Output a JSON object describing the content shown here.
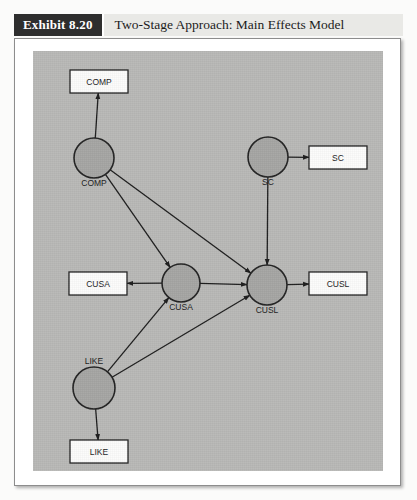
{
  "header": {
    "exhibit_tag": "Exhibit 8.20",
    "title": "Two-Stage Approach: Main Effects Model"
  },
  "colors": {
    "tag_background": "#2e2e2e",
    "tag_text": "#ffffff",
    "title_background": "#e9e9e6",
    "canvas_background": "#b9b9b7",
    "construct_fill": "#a6a6a4",
    "indicator_fill": "#fcfcfb",
    "stroke": "#232323"
  },
  "diagram": {
    "type": "path-model",
    "constructs": [
      {
        "id": "COMP",
        "label": "COMP",
        "cx": 61,
        "cy": 107,
        "r": 20,
        "label_position": "below"
      },
      {
        "id": "SC",
        "label": "SC",
        "cx": 235,
        "cy": 106,
        "r": 20,
        "label_position": "below"
      },
      {
        "id": "CUSA",
        "label": "CUSA",
        "cx": 148,
        "cy": 232,
        "r": 19,
        "label_position": "below"
      },
      {
        "id": "CUSL",
        "label": "CUSL",
        "cx": 234,
        "cy": 234,
        "r": 20,
        "label_position": "below"
      },
      {
        "id": "LIKE",
        "label": "LIKE",
        "cx": 61,
        "cy": 337,
        "r": 21,
        "label_position": "above"
      }
    ],
    "indicators": [
      {
        "id": "COMP_ind",
        "label": "COMP",
        "x": 37,
        "y": 19,
        "w": 58,
        "h": 23
      },
      {
        "id": "SC_ind",
        "label": "SC",
        "x": 276,
        "y": 95,
        "w": 58,
        "h": 23
      },
      {
        "id": "CUSA_ind",
        "label": "CUSA",
        "x": 36,
        "y": 221,
        "w": 58,
        "h": 23
      },
      {
        "id": "CUSL_ind",
        "label": "CUSL",
        "x": 276,
        "y": 221,
        "w": 58,
        "h": 23
      },
      {
        "id": "LIKE_ind",
        "label": "LIKE",
        "x": 37,
        "y": 389,
        "w": 58,
        "h": 23
      }
    ],
    "paths": [
      {
        "from": "COMP",
        "to": "COMP_ind",
        "kind": "measurement"
      },
      {
        "from": "SC",
        "to": "SC_ind",
        "kind": "measurement"
      },
      {
        "from": "CUSA",
        "to": "CUSA_ind",
        "kind": "measurement"
      },
      {
        "from": "CUSL",
        "to": "CUSL_ind",
        "kind": "measurement"
      },
      {
        "from": "LIKE",
        "to": "LIKE_ind",
        "kind": "measurement"
      },
      {
        "from": "COMP",
        "to": "CUSA",
        "kind": "structural"
      },
      {
        "from": "COMP",
        "to": "CUSL",
        "kind": "structural"
      },
      {
        "from": "SC",
        "to": "CUSL",
        "kind": "structural"
      },
      {
        "from": "LIKE",
        "to": "CUSA",
        "kind": "structural"
      },
      {
        "from": "LIKE",
        "to": "CUSL",
        "kind": "structural"
      },
      {
        "from": "CUSA",
        "to": "CUSL",
        "kind": "structural"
      }
    ]
  }
}
